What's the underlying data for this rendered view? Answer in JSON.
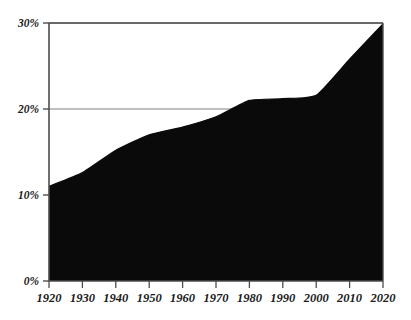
{
  "chart_data": {
    "type": "area",
    "title": "",
    "subtitle": "",
    "xlabel": "",
    "ylabel": "",
    "x": [
      1920,
      1930,
      1940,
      1950,
      1960,
      1970,
      1980,
      1990,
      2000,
      2010,
      2020
    ],
    "values": [
      11.0,
      12.6,
      15.2,
      17.0,
      17.9,
      19.1,
      21.0,
      21.2,
      21.6,
      25.8,
      29.9
    ],
    "series": [
      {
        "name": "",
        "values": [
          11.0,
          12.6,
          15.2,
          17.0,
          17.9,
          19.1,
          21.0,
          21.2,
          21.6,
          25.8,
          29.9
        ]
      }
    ],
    "xlim": [
      1920,
      2020
    ],
    "ylim": [
      0,
      30
    ],
    "x_tick_labels": [
      "1920",
      "1930",
      "1940",
      "1950",
      "1960",
      "1970",
      "1980",
      "1990",
      "2000",
      "2010",
      "2020"
    ],
    "x_tick_values": [
      1920,
      1930,
      1940,
      1950,
      1960,
      1970,
      1980,
      1990,
      2000,
      2010,
      2020
    ],
    "y_tick_labels": [
      "0%",
      "10%",
      "20%",
      "30%"
    ],
    "y_tick_values": [
      0,
      10,
      20,
      30
    ],
    "grid": true,
    "gridlines_y": [
      10,
      20,
      30
    ],
    "legend": false,
    "legend_position": "none",
    "annotations": [],
    "colors": {
      "area_fill": "#0a0a0a",
      "line": "#0a0a0a",
      "axis": "#4d4d4d",
      "gridline": "#808080",
      "background": "#ffffff",
      "tick_text": "#1a1a1a"
    }
  }
}
